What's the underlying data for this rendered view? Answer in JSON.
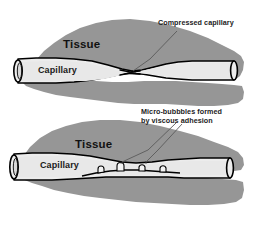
{
  "figure": {
    "background_color": "#ffffff",
    "width": 255,
    "height": 229
  },
  "palette": {
    "tissue_fill": "#969696",
    "capillary_fill": "#e2e2e2",
    "capillary_lumen_fill": "#ececec",
    "outline": "#000000",
    "text": "#1a1a1a",
    "leader_line": "#555555",
    "bubble_fill": "#f2f2f2"
  },
  "panels": [
    {
      "id": "panel-top",
      "name": "compressed-capillary-panel",
      "tissue_label": "Tissue",
      "capillary_label": "Capillary",
      "annotation": {
        "lines": [
          "Compressed capillary"
        ],
        "text": "Compressed capillary"
      },
      "bubbles_count": 0,
      "state": "compressed"
    },
    {
      "id": "panel-bottom",
      "name": "micro-bubbles-panel",
      "tissue_label": "Tissue",
      "capillary_label": "Capillary",
      "annotation": {
        "lines": [
          "Micro-bubbbles formed",
          "by viscous adhesion"
        ],
        "line1": "Micro-bubbbles formed",
        "line2": "by viscous adhesion"
      },
      "bubbles_count": 4,
      "state": "micro-bubbles"
    }
  ],
  "labels": {
    "top_tissue": "Tissue",
    "top_capillary": "Capillary",
    "top_annotation": "Compressed capillary",
    "bottom_tissue": "Tissue",
    "bottom_capillary": "Capillary",
    "bottom_annotation_line1": "Micro-bubbbles formed",
    "bottom_annotation_line2": "by viscous adhesion"
  }
}
